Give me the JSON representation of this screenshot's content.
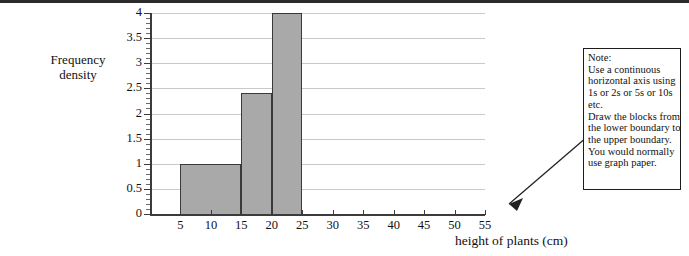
{
  "chart_data": {
    "type": "bar",
    "title": "",
    "subtitle": "",
    "xlabel": "height of plants (cm)",
    "ylabel": "Frequency density",
    "ylabel_lines": [
      "Frequency",
      "density"
    ],
    "xlim": [
      0,
      55
    ],
    "ylim": [
      0,
      4
    ],
    "grid": true,
    "legend": false,
    "legend_position": "none",
    "x_ticks": [
      5,
      10,
      15,
      20,
      25,
      30,
      35,
      40,
      45,
      50,
      55
    ],
    "x_tick_labels": [
      "5",
      "10",
      "15",
      "20",
      "25",
      "30",
      "35",
      "40",
      "45",
      "50",
      "55"
    ],
    "y_ticks": [
      0,
      0.5,
      1,
      1.5,
      2,
      2.5,
      3,
      3.5,
      4
    ],
    "y_tick_labels": [
      "0",
      "0.5",
      "1",
      "1.5",
      "2",
      "2.5",
      "3",
      "3.5",
      "4"
    ],
    "y_minor_tick_step": 0.1,
    "bar_fill_color": "#a9a9a9",
    "bar_edge_color": "#3a3a3a",
    "gridline_color": "#c9c9c9",
    "axis_color": "#3b3b3b",
    "bars": [
      {
        "x_start": 5,
        "x_end": 15,
        "value": 1.0,
        "label": "5 - 15"
      },
      {
        "x_start": 15,
        "x_end": 20,
        "value": 2.4,
        "label": "15 - 20"
      },
      {
        "x_start": 20,
        "x_end": 25,
        "value": 4.0,
        "label": "20 - 25"
      }
    ],
    "categories": [
      "5 - 15",
      "15 - 20",
      "20 - 25"
    ],
    "values": [
      1.0,
      2.4,
      4.0
    ]
  },
  "annotation": {
    "note_lines": [
      "Note:",
      "Use a continuous",
      "horizontal axis using",
      "1s or 2s or 5s or 10s",
      "etc.",
      "Draw the blocks from",
      "the lower boundary to",
      "the upper boundary.",
      "You would normally",
      "use graph paper."
    ],
    "arrow_target": "end of horizontal axis near 55"
  }
}
